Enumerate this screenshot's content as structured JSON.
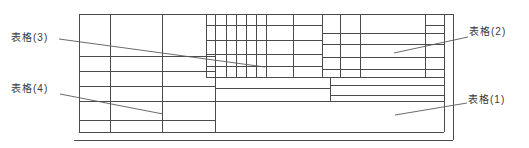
{
  "figure": {
    "type": "table-layout-diagram",
    "background_color": "#ffffff",
    "line_color": "#4a4a4a",
    "labels": {
      "table1": "表格(1)",
      "table2": "表格(2)",
      "table3": "表格(3)",
      "table4": "表格(4)"
    },
    "regions": {
      "table1_desc": "large bottom cell of title block",
      "table2_desc": "upper-right fine-row grid",
      "table3_desc": "upper-middle dense column grid",
      "table4_desc": "left stacked-row table"
    }
  }
}
